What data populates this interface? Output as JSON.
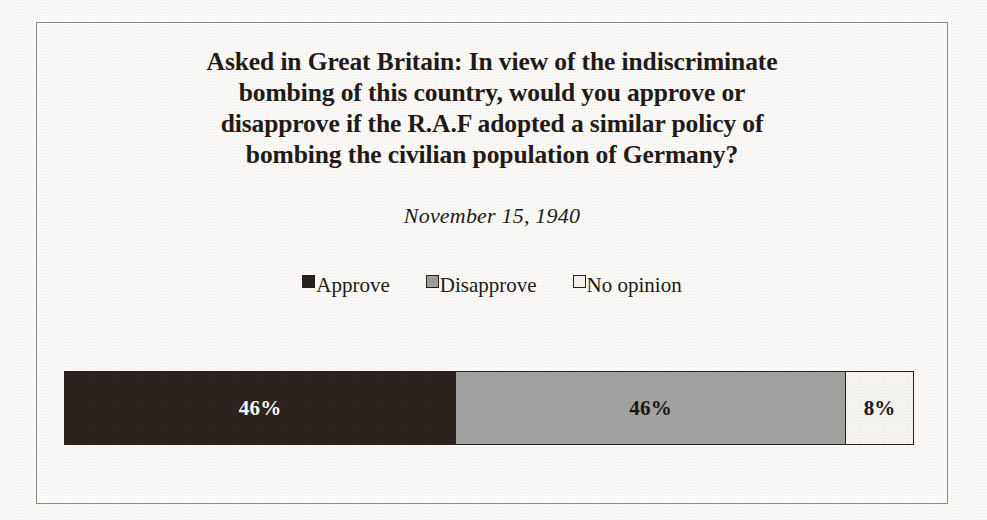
{
  "figure": {
    "background_color": "#fcfbf9",
    "frame_color": "#8d8d86"
  },
  "title": {
    "lines": [
      "Asked in Great Britain: In view of the indiscriminate",
      "bombing of this country, would you approve or",
      "disapprove if the R.A.F adopted a similar policy of",
      "bombing the civilian population of Germany?"
    ]
  },
  "subtitle": {
    "text": "November 15, 1940"
  },
  "legend": {
    "position": "above-plot-center",
    "items": [
      {
        "label": "Approve",
        "color": "#2b211c",
        "swatch": "filled-square-icon"
      },
      {
        "label": "Disapprove",
        "color": "#9e9e9c",
        "swatch": "filled-square-icon"
      },
      {
        "label": "No opinion",
        "color": "#f6f4ef",
        "swatch": "empty-square-icon"
      }
    ]
  },
  "chart_data": {
    "type": "bar",
    "orientation": "horizontal",
    "stacked": true,
    "normalized_to_percent": true,
    "subtitle": "November 15, 1940",
    "xlabel": "",
    "ylabel": "",
    "xlim": [
      0,
      100
    ],
    "grid": false,
    "legend_position": "top-center",
    "categories": [
      "Response"
    ],
    "series": [
      {
        "name": "Approve",
        "values": [
          46
        ],
        "label": "46%",
        "color": "#2e241f",
        "label_color": "#fdfdfb"
      },
      {
        "name": "Disapprove",
        "values": [
          46
        ],
        "label": "46%",
        "color": "#a3a3a1",
        "label_color": "#1d1713"
      },
      {
        "name": "No opinion",
        "values": [
          8
        ],
        "label": "8%",
        "color": "#f7f5f0",
        "label_color": "#1d1713"
      }
    ],
    "tick_labels": [],
    "annotations": []
  }
}
